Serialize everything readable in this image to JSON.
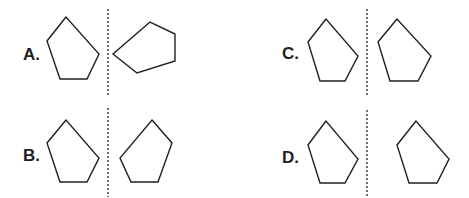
{
  "stroke_color": "#231f20",
  "options": [
    {
      "id": "A",
      "label": "A.",
      "label_pos": [
        23,
        60
      ],
      "mirror_line": {
        "x": 108,
        "y1": 9,
        "y2": 97
      },
      "left_shape": "66,17 47,41 60,79 87,79 99,54",
      "right_shape": "150,22 113,54 137,73 175,61 175,34"
    },
    {
      "id": "B",
      "label": "B.",
      "label_pos": [
        23,
        161
      ],
      "mirror_line": {
        "x": 108,
        "y1": 108,
        "y2": 197
      },
      "left_shape": "66,120 47,143 60,182 87,182 99,158",
      "right_shape": "152,120 172,143 158,182 131,182 120,158"
    },
    {
      "id": "C",
      "label": "C.",
      "label_pos": [
        282,
        59
      ],
      "mirror_line": {
        "x": 367,
        "y1": 9,
        "y2": 97
      },
      "left_shape": "326,19 308,42 320,81 345,81 358,56",
      "right_shape": "397,19 378,42 390,81 418,81 431,56"
    },
    {
      "id": "D",
      "label": "D.",
      "label_pos": [
        282,
        163
      ],
      "mirror_line": {
        "x": 367,
        "y1": 110,
        "y2": 197
      },
      "left_shape": "326,121 308,145 320,183 345,183 358,159",
      "right_shape": "416,121 397,145 409,183 437,183 449,159"
    }
  ]
}
